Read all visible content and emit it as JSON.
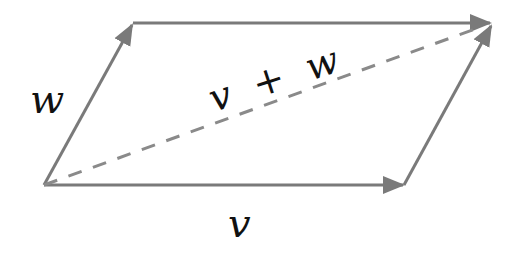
{
  "diagram": {
    "labels": {
      "w": "w",
      "v": "v",
      "sum": "v + w"
    },
    "colors": {
      "stroke": "#7a7a7a",
      "text": "#111111",
      "background": "#ffffff"
    },
    "points": {
      "origin": [
        44,
        185
      ],
      "w_tip": [
        133,
        23
      ],
      "v_tip": [
        404,
        185
      ],
      "sum_tip": [
        492,
        23
      ]
    }
  }
}
